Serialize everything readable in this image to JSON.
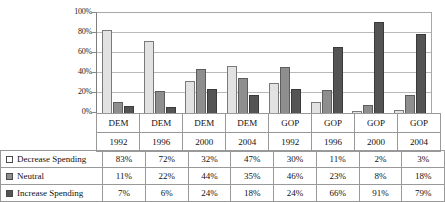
{
  "chart_data": {
    "type": "bar",
    "title": "",
    "subtitle": "",
    "xlabel": "",
    "ylabel": "",
    "ylim": [
      0,
      100
    ],
    "yticks": [
      "0%",
      "20%",
      "40%",
      "60%",
      "80%",
      "100%"
    ],
    "grid": true,
    "legend_position": "table-left",
    "categories": [
      {
        "party": "DEM",
        "year": "1992"
      },
      {
        "party": "DEM",
        "year": "1996"
      },
      {
        "party": "DEM",
        "year": "2000"
      },
      {
        "party": "DEM",
        "year": "2004"
      },
      {
        "party": "GOP",
        "year": "1992"
      },
      {
        "party": "GOP",
        "year": "1996"
      },
      {
        "party": "GOP",
        "year": "2000"
      },
      {
        "party": "GOP",
        "year": "2004"
      }
    ],
    "series": [
      {
        "name": "Decrease Spending",
        "color": "#e2e2e2",
        "values": [
          83,
          72,
          32,
          47,
          30,
          11,
          2,
          3
        ],
        "labels": [
          "83%",
          "72%",
          "32%",
          "47%",
          "30%",
          "11%",
          "2%",
          "3%"
        ]
      },
      {
        "name": "Neutral",
        "color": "#8e8e8e",
        "values": [
          11,
          22,
          44,
          35,
          46,
          23,
          8,
          18
        ],
        "labels": [
          "11%",
          "22%",
          "44%",
          "35%",
          "46%",
          "23%",
          "8%",
          "18%"
        ]
      },
      {
        "name": "Increase Spending",
        "color": "#545454",
        "values": [
          7,
          6,
          24,
          18,
          24,
          66,
          91,
          79
        ],
        "labels": [
          "7%",
          "6%",
          "24%",
          "18%",
          "24%",
          "66%",
          "91%",
          "79%"
        ]
      }
    ]
  }
}
